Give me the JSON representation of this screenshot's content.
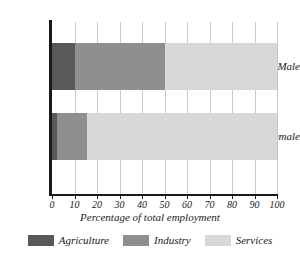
{
  "chart_data": {
    "type": "bar",
    "orientation": "horizontal",
    "stacked": true,
    "title": "",
    "xlabel": "Percentage of total employment",
    "ylabel": "",
    "xlim": [
      0,
      100
    ],
    "xticks": [
      0,
      10,
      20,
      30,
      40,
      50,
      60,
      70,
      80,
      90,
      100
    ],
    "xtick_labels": [
      "0",
      "10",
      "20",
      "30",
      "40",
      "50",
      "60",
      "70",
      "80",
      "90",
      "100"
    ],
    "categories": [
      "Male",
      "Female"
    ],
    "grid": "vertical",
    "legend_position": "bottom",
    "series": [
      {
        "name": "Agriculture",
        "color": "#595959",
        "values": [
          10,
          2
        ]
      },
      {
        "name": "Industry",
        "color": "#8f8f8f",
        "values": [
          40,
          13.5
        ]
      },
      {
        "name": "Services",
        "color": "#d8d8d8",
        "values": [
          50,
          84.5
        ]
      }
    ]
  },
  "axis": {
    "line_color": "#1a1a1a",
    "grid_color": "#c9c9c9"
  },
  "legend": {
    "entries": [
      {
        "label": "Agriculture",
        "color": "#595959"
      },
      {
        "label": "Industry",
        "color": "#8f8f8f"
      },
      {
        "label": "Services",
        "color": "#d8d8d8"
      }
    ]
  }
}
